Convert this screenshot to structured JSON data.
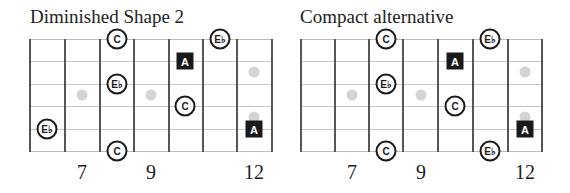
{
  "colors": {
    "fret_line": "#555555",
    "string_line": "#c8c8c8",
    "inlay": "#d4d4d4",
    "root_fill": "#1a1a1a",
    "note_outline": "#1a1a1a"
  },
  "fret_numbers": [
    "7",
    "9",
    "12"
  ],
  "diagrams": [
    {
      "title": "Diminished Shape 2",
      "notes": [
        {
          "label": "C",
          "shape": "circle",
          "string": 1,
          "fret_col": 3
        },
        {
          "label": "E♭",
          "shape": "circle",
          "string": 1,
          "fret_col": 6
        },
        {
          "label": "A",
          "shape": "square",
          "string": 2,
          "fret_col": 5
        },
        {
          "label": "E♭",
          "shape": "circle",
          "string": 3,
          "fret_col": 3
        },
        {
          "label": "C",
          "shape": "circle",
          "string": 4,
          "fret_col": 5
        },
        {
          "label": "E♭",
          "shape": "circle",
          "string": 5,
          "fret_col": 1
        },
        {
          "label": "A",
          "shape": "square",
          "string": 5,
          "fret_col": 7
        },
        {
          "label": "C",
          "shape": "circle",
          "string": 6,
          "fret_col": 3
        }
      ]
    },
    {
      "title": "Compact alternative",
      "notes": [
        {
          "label": "C",
          "shape": "circle",
          "string": 1,
          "fret_col": 3
        },
        {
          "label": "E♭",
          "shape": "circle",
          "string": 1,
          "fret_col": 6
        },
        {
          "label": "A",
          "shape": "square",
          "string": 2,
          "fret_col": 5
        },
        {
          "label": "E♭",
          "shape": "circle",
          "string": 3,
          "fret_col": 3
        },
        {
          "label": "C",
          "shape": "circle",
          "string": 4,
          "fret_col": 5
        },
        {
          "label": "A",
          "shape": "square",
          "string": 5,
          "fret_col": 7
        },
        {
          "label": "C",
          "shape": "circle",
          "string": 6,
          "fret_col": 3
        },
        {
          "label": "E♭",
          "shape": "circle",
          "string": 6,
          "fret_col": 6
        }
      ]
    }
  ]
}
